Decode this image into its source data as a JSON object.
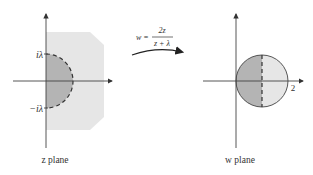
{
  "z_plane": {
    "caption": "z plane",
    "label_top": "iλ",
    "label_bottom": "−iλ",
    "region_color": "#e6e6e6",
    "disk_color": "#b4b4b4"
  },
  "mapping": {
    "lhs": "w =",
    "numerator": "2z",
    "denominator": "z + λ"
  },
  "w_plane": {
    "caption": "w plane",
    "label_x": "2",
    "left_half_color": "#b4b4b4",
    "right_half_color": "#e6e6e6"
  }
}
